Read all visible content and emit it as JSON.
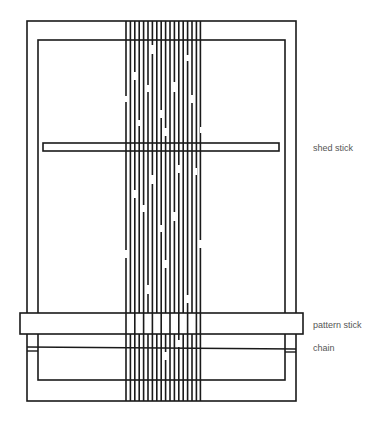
{
  "diagram": {
    "labels": {
      "shed_stick": "shed stick",
      "pattern_stick": "pattern stick",
      "chain": "chain"
    },
    "colors": {
      "line": "#1a1a1a",
      "label": "#555555",
      "background": "#ffffff"
    },
    "warp_thread_count": 18
  }
}
